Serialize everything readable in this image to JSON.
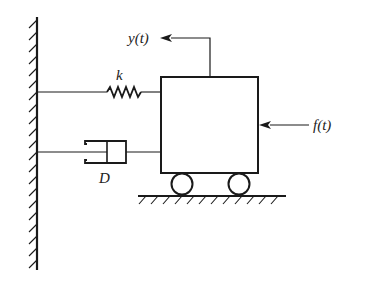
{
  "diagram": {
    "type": "mass-spring-damper",
    "labels": {
      "spring": "k",
      "damper": "D",
      "displacement": "y(t)",
      "force": "f(t)"
    },
    "colors": {
      "stroke": "#1a1a1a",
      "background": "#ffffff"
    }
  }
}
